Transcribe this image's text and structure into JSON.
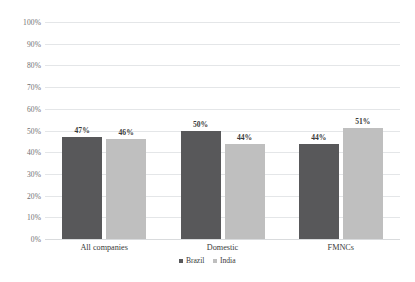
{
  "chart_data": {
    "type": "bar",
    "title": "",
    "subtitle": "",
    "xlabel": "",
    "ylabel": "",
    "categories": [
      "All companies",
      "Domestic",
      "FMNCs"
    ],
    "series": [
      {
        "name": "Brazil",
        "color": "#58585a",
        "values": [
          47,
          50,
          44
        ],
        "labels": [
          "47%",
          "50%",
          "44%"
        ]
      },
      {
        "name": "India",
        "color": "#bfbfbf",
        "values": [
          46,
          44,
          51
        ],
        "labels": [
          "46%",
          "44%",
          "51%"
        ]
      }
    ],
    "ylim": [
      0,
      100
    ],
    "ytick_values": [
      100,
      90,
      80,
      70,
      60,
      50,
      40,
      30,
      20,
      10,
      0
    ],
    "ytick_labels": [
      "100%",
      "90%",
      "80%",
      "70%",
      "60%",
      "50%",
      "40%",
      "30%",
      "20%",
      "10%",
      "0%"
    ],
    "grid": true,
    "grid_color": "#e4e6e8",
    "legend_position": "bottom-center",
    "background": "#ffffff",
    "value_unit": "%"
  }
}
